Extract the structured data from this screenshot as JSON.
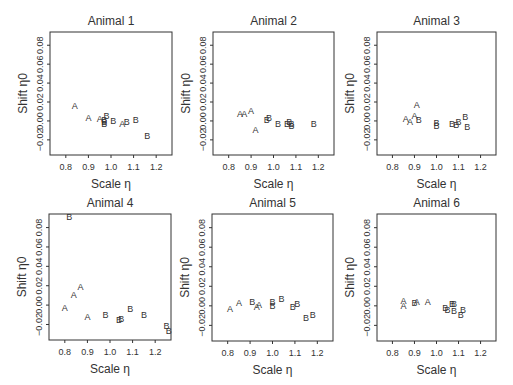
{
  "figure": {
    "layout": {
      "rows": 2,
      "cols": 3
    },
    "axis_style": {
      "frame_color": "#333333",
      "text_color": "#333333",
      "point_color": "#333333"
    }
  },
  "chart_data": [
    {
      "type": "scatter",
      "title": "Animal 1",
      "xlabel": "Scale η",
      "ylabel": "Shift η0",
      "xlim": [
        0.73,
        1.27
      ],
      "ylim": [
        -0.036,
        0.094
      ],
      "xticks": [
        "0.8",
        "0.9",
        "1.0",
        "1.1",
        "1.2"
      ],
      "yticks": [
        "-0.02",
        "0.00",
        "0.02",
        "0.04",
        "0.06",
        "0.08"
      ],
      "grid": false,
      "legend": null,
      "series": [
        {
          "name": "A",
          "points": [
            [
              0.84,
              0.016
            ],
            [
              0.9,
              0.004
            ],
            [
              0.95,
              0.003
            ],
            [
              1.05,
              -0.003
            ]
          ]
        },
        {
          "name": "B",
          "points": [
            [
              0.97,
              0.001
            ],
            [
              0.97,
              -0.001
            ],
            [
              0.97,
              -0.003
            ],
            [
              0.98,
              0.006
            ],
            [
              1.01,
              0.0
            ],
            [
              1.07,
              -0.001
            ],
            [
              1.11,
              0.001
            ],
            [
              1.16,
              -0.015
            ]
          ]
        }
      ]
    },
    {
      "type": "scatter",
      "title": "Animal 2",
      "xlabel": "Scale η",
      "ylabel": "Shift η0",
      "xlim": [
        0.73,
        1.27
      ],
      "ylim": [
        -0.036,
        0.094
      ],
      "xticks": [
        "0.8",
        "0.9",
        "1.0",
        "1.1",
        "1.2"
      ],
      "yticks": [
        "-0.02",
        "0.00",
        "0.02",
        "0.04",
        "0.06",
        "0.08"
      ],
      "grid": false,
      "legend": null,
      "series": [
        {
          "name": "A",
          "points": [
            [
              0.85,
              0.008
            ],
            [
              0.87,
              0.008
            ],
            [
              0.9,
              0.011
            ],
            [
              0.92,
              -0.009
            ]
          ]
        },
        {
          "name": "B",
          "points": [
            [
              0.97,
              0.001
            ],
            [
              0.98,
              0.004
            ],
            [
              1.02,
              -0.003
            ],
            [
              1.06,
              -0.003
            ],
            [
              1.07,
              -0.001
            ],
            [
              1.08,
              -0.003
            ],
            [
              1.08,
              -0.005
            ],
            [
              1.18,
              -0.003
            ]
          ]
        }
      ]
    },
    {
      "type": "scatter",
      "title": "Animal 3",
      "xlabel": "Scale η",
      "ylabel": "Shift η0",
      "xlim": [
        0.73,
        1.27
      ],
      "ylim": [
        -0.036,
        0.094
      ],
      "xticks": [
        "0.8",
        "0.9",
        "1.0",
        "1.1",
        "1.2"
      ],
      "yticks": [
        "-0.02",
        "0.00",
        "0.02",
        "0.04",
        "0.06",
        "0.08"
      ],
      "grid": false,
      "legend": null,
      "series": [
        {
          "name": "A",
          "points": [
            [
              0.86,
              0.003
            ],
            [
              0.88,
              -0.001
            ],
            [
              0.9,
              0.006
            ],
            [
              0.91,
              0.017
            ]
          ]
        },
        {
          "name": "B",
          "points": [
            [
              0.92,
              0.002
            ],
            [
              1.0,
              -0.002
            ],
            [
              1.0,
              -0.005
            ],
            [
              1.07,
              -0.003
            ],
            [
              1.09,
              -0.004
            ],
            [
              1.1,
              -0.001
            ],
            [
              1.13,
              0.005
            ],
            [
              1.14,
              -0.006
            ]
          ]
        }
      ]
    },
    {
      "type": "scatter",
      "title": "Animal 4",
      "xlabel": "Scale η",
      "ylabel": "Shift η0",
      "xlim": [
        0.73,
        1.27
      ],
      "ylim": [
        -0.036,
        0.094
      ],
      "xticks": [
        "0.8",
        "0.9",
        "1.0",
        "1.1",
        "1.2"
      ],
      "yticks": [
        "-0.02",
        "0.00",
        "0.02",
        "0.04",
        "0.06",
        "0.08"
      ],
      "grid": false,
      "legend": null,
      "series": [
        {
          "name": "A",
          "points": [
            [
              0.8,
              -0.002
            ],
            [
              0.84,
              0.011
            ],
            [
              0.87,
              0.019
            ],
            [
              0.9,
              -0.012
            ]
          ]
        },
        {
          "name": "B",
          "points": [
            [
              0.82,
              0.091
            ],
            [
              0.98,
              -0.01
            ],
            [
              1.04,
              -0.015
            ],
            [
              1.05,
              -0.014
            ],
            [
              1.09,
              -0.003
            ],
            [
              1.15,
              -0.01
            ],
            [
              1.25,
              -0.021
            ],
            [
              1.26,
              -0.026
            ]
          ]
        }
      ]
    },
    {
      "type": "scatter",
      "title": "Animal 5",
      "xlabel": "Scale η",
      "ylabel": "Shift η0",
      "xlim": [
        0.73,
        1.27
      ],
      "ylim": [
        -0.036,
        0.094
      ],
      "xticks": [
        "0.8",
        "0.9",
        "1.0",
        "1.1",
        "1.2"
      ],
      "yticks": [
        "-0.02",
        "0.00",
        "0.02",
        "0.04",
        "0.06",
        "0.08"
      ],
      "grid": false,
      "legend": null,
      "series": [
        {
          "name": "A",
          "points": [
            [
              0.81,
              -0.003
            ],
            [
              0.85,
              0.003
            ],
            [
              0.93,
              -0.001
            ],
            [
              0.94,
              0.001
            ]
          ]
        },
        {
          "name": "B",
          "points": [
            [
              0.91,
              0.004
            ],
            [
              1.0,
              0.004
            ],
            [
              1.0,
              0.0
            ],
            [
              1.04,
              0.008
            ],
            [
              1.09,
              -0.001
            ],
            [
              1.11,
              0.002
            ],
            [
              1.15,
              -0.012
            ],
            [
              1.18,
              -0.009
            ]
          ]
        }
      ]
    },
    {
      "type": "scatter",
      "title": "Animal 6",
      "xlabel": "Scale η",
      "ylabel": "Shift η0",
      "xlim": [
        0.73,
        1.27
      ],
      "ylim": [
        -0.036,
        0.094
      ],
      "xticks": [
        "0.8",
        "0.9",
        "1.0",
        "1.1",
        "1.2"
      ],
      "yticks": [
        "-0.02",
        "0.00",
        "0.02",
        "0.04",
        "0.06",
        "0.08"
      ],
      "grid": false,
      "legend": null,
      "series": [
        {
          "name": "A",
          "points": [
            [
              0.85,
              0.005
            ],
            [
              0.85,
              0.0
            ],
            [
              0.91,
              0.004
            ],
            [
              0.96,
              0.004
            ]
          ]
        },
        {
          "name": "B",
          "points": [
            [
              0.9,
              0.003
            ],
            [
              1.04,
              -0.002
            ],
            [
              1.05,
              -0.004
            ],
            [
              1.07,
              0.002
            ],
            [
              1.08,
              0.002
            ],
            [
              1.08,
              -0.005
            ],
            [
              1.11,
              -0.009
            ],
            [
              1.12,
              -0.004
            ]
          ]
        }
      ]
    }
  ]
}
